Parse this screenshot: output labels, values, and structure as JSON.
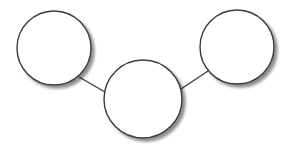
{
  "diagram": {
    "type": "node-graph",
    "background": "#ffffff",
    "stroke_color": "#3a3a3a",
    "fill_color": "#ffffff",
    "shadow_color": "#9a9a9a",
    "nodes": [
      {
        "id": "left",
        "label": "",
        "cx": 54,
        "cy": 48,
        "r": 37
      },
      {
        "id": "center",
        "label": "",
        "cx": 143,
        "cy": 99,
        "r": 39
      },
      {
        "id": "right",
        "label": "",
        "cx": 237,
        "cy": 47,
        "r": 37
      }
    ],
    "edges": [
      {
        "from": "left",
        "to": "center",
        "x1": 79,
        "y1": 77,
        "x2": 105,
        "y2": 92
      },
      {
        "from": "center",
        "to": "right",
        "x1": 181,
        "y1": 89,
        "x2": 208,
        "y2": 71
      }
    ]
  }
}
